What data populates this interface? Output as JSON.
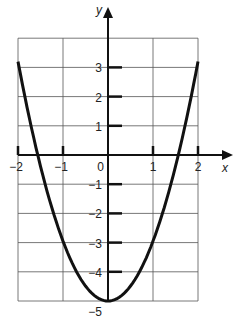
{
  "chart_data": {
    "type": "line",
    "title": "",
    "xlabel": "x",
    "ylabel": "y",
    "xlim": [
      -2,
      2
    ],
    "ylim": [
      -5,
      4
    ],
    "grid": true,
    "x_ticks": [
      "-2",
      "-1",
      "0",
      "1",
      "2"
    ],
    "y_ticks": [
      "3",
      "2",
      "1",
      "-1",
      "-2",
      "-3",
      "-4",
      "-5"
    ],
    "series": [
      {
        "name": "parabola",
        "function": "y = 2x^2 - 5",
        "x": [
          -2,
          -1.5,
          -1,
          -0.5,
          0,
          0.5,
          1,
          1.5,
          2
        ],
        "y": [
          3.2,
          -0.5,
          -3,
          -4.5,
          -5,
          -4.5,
          -3,
          -0.5,
          3.2
        ]
      }
    ]
  },
  "labels": {
    "x_axis": "x",
    "y_axis": "y",
    "origin": "0"
  },
  "colors": {
    "line": "#111111",
    "grid": "#555555",
    "text": "#222222"
  }
}
